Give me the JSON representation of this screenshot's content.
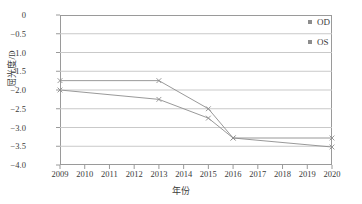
{
  "chart_data": {
    "type": "line",
    "title": "",
    "xlabel": "年份",
    "ylabel": "屈光度/D",
    "x": [
      2009,
      2013,
      2015,
      2016,
      2020
    ],
    "categories": [
      "2009",
      "2010",
      "2011",
      "2012",
      "2013",
      "2014",
      "2015",
      "2016",
      "2017",
      "2018",
      "2019",
      "2020"
    ],
    "xlim": [
      2009,
      2020
    ],
    "ylim": [
      -4.0,
      0
    ],
    "yticks": [
      0,
      -0.5,
      -1.0,
      -1.5,
      -2.0,
      -2.5,
      -3.0,
      -3.5,
      -4.0
    ],
    "ytick_labels": [
      "0",
      "−0.5",
      "−1.0",
      "−1.5",
      "−2.0",
      "−2.5",
      "−3.0",
      "−3.5",
      "−4.0"
    ],
    "grid": true,
    "legend_position": "top-right",
    "series": [
      {
        "name": "OD",
        "color": "#8d8d8d",
        "marker": "x",
        "points": [
          {
            "x": 2009,
            "y": -1.75
          },
          {
            "x": 2013,
            "y": -1.75
          },
          {
            "x": 2015,
            "y": -2.5
          },
          {
            "x": 2016,
            "y": -3.28
          },
          {
            "x": 2020,
            "y": -3.28
          }
        ]
      },
      {
        "name": "OS",
        "color": "#8d8d8d",
        "marker": "x",
        "points": [
          {
            "x": 2009,
            "y": -2.0
          },
          {
            "x": 2013,
            "y": -2.25
          },
          {
            "x": 2015,
            "y": -2.75
          },
          {
            "x": 2016,
            "y": -3.28
          },
          {
            "x": 2020,
            "y": -3.52
          }
        ]
      }
    ]
  },
  "legend": {
    "items": [
      {
        "label": "OD"
      },
      {
        "label": "OS"
      }
    ]
  }
}
